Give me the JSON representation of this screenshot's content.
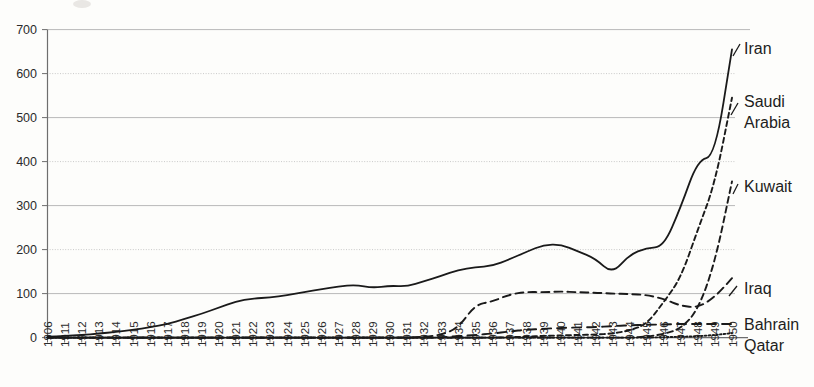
{
  "chart_data": {
    "type": "line",
    "title": "",
    "subtitle": "",
    "xlabel": "",
    "ylabel": "",
    "xlim": [
      1906,
      1950
    ],
    "ylim": [
      0,
      700
    ],
    "yticks": [
      0,
      100,
      200,
      300,
      400,
      500,
      600,
      700
    ],
    "grid": true,
    "legend_position": "right-inline-labels",
    "categories": [
      "1906",
      "1911",
      "1912",
      "1913",
      "1914",
      "1915",
      "1916",
      "1917",
      "1918",
      "1919",
      "1920",
      "1921",
      "1922",
      "1923",
      "1924",
      "1925",
      "1926",
      "1927",
      "1928",
      "1929",
      "1930",
      "1931",
      "1932",
      "1933",
      "1934",
      "1935",
      "1936",
      "1937",
      "1938",
      "1939",
      "1940",
      "1941",
      "1942",
      "1943",
      "1944",
      "1945",
      "1946",
      "1947",
      "1948",
      "1949",
      "1950"
    ],
    "series": [
      {
        "name": "Iran",
        "style": "solid",
        "values": [
          2,
          4,
          6,
          9,
          13,
          18,
          23,
          31,
          42,
          54,
          68,
          82,
          89,
          91,
          96,
          104,
          110,
          116,
          120,
          113,
          118,
          116,
          128,
          140,
          154,
          160,
          163,
          178,
          195,
          211,
          212,
          196,
          180,
          145,
          188,
          204,
          206,
          262,
          330,
          388,
          404
        ],
        "values_tail_note": "rises steeply after 1946 to 655 at 1950",
        "values_full": [
          2,
          4,
          6,
          9,
          13,
          18,
          23,
          31,
          42,
          54,
          68,
          82,
          89,
          91,
          96,
          104,
          110,
          116,
          120,
          113,
          118,
          116,
          128,
          140,
          154,
          160,
          163,
          178,
          195,
          211,
          212,
          196,
          180,
          145,
          188,
          204,
          206,
          296,
          404,
          412,
          655
        ]
      },
      {
        "name": "Saudi Arabia",
        "style": "dashed",
        "values": [
          0,
          0,
          0,
          0,
          0,
          0,
          0,
          0,
          0,
          0,
          0,
          0,
          0,
          0,
          0,
          0,
          0,
          0,
          0,
          0,
          0,
          0,
          0,
          0,
          0,
          0,
          0,
          1,
          2,
          4,
          5,
          6,
          7,
          9,
          16,
          30,
          80,
          135,
          245,
          350,
          545
        ]
      },
      {
        "name": "Kuwait",
        "style": "dashed",
        "values": [
          0,
          0,
          0,
          0,
          0,
          0,
          0,
          0,
          0,
          0,
          0,
          0,
          0,
          0,
          0,
          0,
          0,
          0,
          0,
          0,
          0,
          0,
          0,
          0,
          0,
          0,
          0,
          0,
          0,
          0,
          0,
          0,
          0,
          0,
          0,
          2,
          8,
          20,
          62,
          170,
          355
        ]
      },
      {
        "name": "Iraq",
        "style": "dashed",
        "values": [
          0,
          0,
          0,
          0,
          0,
          0,
          0,
          0,
          0,
          0,
          0,
          0,
          0,
          0,
          0,
          0,
          0,
          0,
          0,
          0,
          0,
          0,
          2,
          6,
          22,
          75,
          82,
          98,
          104,
          103,
          105,
          103,
          102,
          100,
          99,
          97,
          88,
          72,
          68,
          92,
          135
        ]
      },
      {
        "name": "Bahrain",
        "style": "dashed",
        "values": [
          0,
          0,
          0,
          0,
          0,
          0,
          0,
          0,
          0,
          0,
          0,
          0,
          0,
          0,
          0,
          0,
          0,
          0,
          0,
          0,
          0,
          0,
          0,
          1,
          3,
          6,
          9,
          14,
          18,
          20,
          22,
          23,
          24,
          26,
          28,
          29,
          30,
          31,
          31,
          31,
          31
        ]
      },
      {
        "name": "Qatar",
        "style": "dotted",
        "values": [
          0,
          0,
          0,
          0,
          0,
          0,
          0,
          0,
          0,
          0,
          0,
          0,
          0,
          0,
          0,
          0,
          0,
          0,
          0,
          0,
          0,
          0,
          0,
          0,
          0,
          0,
          0,
          0,
          0,
          0,
          0,
          0,
          0,
          0,
          0,
          0,
          1,
          2,
          3,
          6,
          10
        ]
      }
    ],
    "series_labels": [
      {
        "name": "Iran",
        "label": "Iran"
      },
      {
        "name": "Saudi Arabia",
        "label_line1": "Saudi",
        "label_line2": "Arabia"
      },
      {
        "name": "Kuwait",
        "label": "Kuwait"
      },
      {
        "name": "Iraq",
        "label": "Iraq"
      },
      {
        "name": "Bahrain",
        "label": "Bahrain"
      },
      {
        "name": "Qatar",
        "label": "Qatar"
      }
    ]
  },
  "colors": {
    "background": "#fdfdfb",
    "line": "#1a1a1a",
    "gridline_solid": "#b9b9b9",
    "gridline_dotted": "#c9c9c9",
    "axis": "#6e6e6e",
    "text": "#2b2b2b"
  },
  "labels": {
    "iran": "Iran",
    "saudi_line1": "Saudi",
    "saudi_line2": "Arabia",
    "kuwait": "Kuwait",
    "iraq": "Iraq",
    "bahrain": "Bahrain",
    "qatar": "Qatar"
  }
}
